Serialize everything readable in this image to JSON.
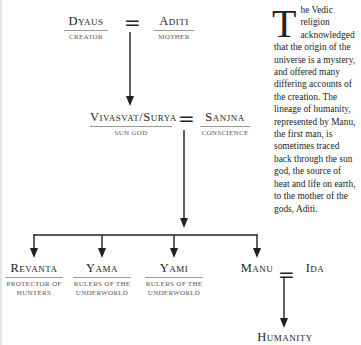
{
  "diagram": {
    "nodes": {
      "dyaus": {
        "name": "Dyaus",
        "role": "Creator"
      },
      "aditi": {
        "name": "Aditi",
        "role": "Mother"
      },
      "vivasvat": {
        "name": "Vivasvat/Surya",
        "role": "Sun God"
      },
      "sanjna": {
        "name": "Sanjna",
        "role": "Conscience"
      },
      "revanta": {
        "name": "Revanta",
        "role_line1": "Protector of",
        "role_line2": "Hunters"
      },
      "yama": {
        "name": "Yama",
        "role_line1": "Rulers of the",
        "role_line2": "Underworld"
      },
      "yami": {
        "name": "Yami",
        "role_line1": "Rulers of the",
        "role_line2": "Underworld"
      },
      "manu": {
        "name": "Manu"
      },
      "ida": {
        "name": "Ida"
      },
      "humanity": {
        "name": "Humanity"
      }
    },
    "marriage_symbol": "="
  },
  "sidebar_text": {
    "dropcap": "T",
    "body": "he Vedic religion acknowledged that the origin of the universe is a mystery, and offered many differing accounts of the creation. The lineage of humanity, represented by Manu, the first man, is sometimes traced back through the sun god, the source of heat and life on earth, to the mother of the gods, Aditi."
  },
  "colors": {
    "ink": "#231f20",
    "rule": "#9a9a9a",
    "background": "#ffffff"
  }
}
